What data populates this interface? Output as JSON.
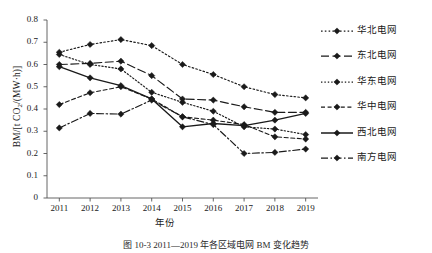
{
  "chart_data": {
    "type": "line",
    "title": "",
    "xlabel": "年份",
    "ylabel": "BM/[t CO2/(MW·h)]",
    "x": [
      2011,
      2012,
      2013,
      2014,
      2015,
      2016,
      2017,
      2018,
      2019
    ],
    "xlim": [
      2010.6,
      2019.4
    ],
    "ylim": [
      0,
      0.8
    ],
    "yticks": [
      "0",
      "0.1",
      "0.2",
      "0.3",
      "0.4",
      "0.5",
      "0.6",
      "0.7",
      "0.8"
    ],
    "ytick_values": [
      0,
      0.1,
      0.2,
      0.3,
      0.4,
      0.5,
      0.6,
      0.7,
      0.8
    ],
    "xticks": [
      "2011",
      "2012",
      "2013",
      "2014",
      "2015",
      "2016",
      "2017",
      "2018",
      "2019"
    ],
    "grid": false,
    "legend_position": "right",
    "series": [
      {
        "name": "华北电网",
        "style": "dotted",
        "dash": "1.6,2.2",
        "color": "#1a1a1a",
        "values": [
          0.655,
          0.69,
          0.712,
          0.685,
          0.6,
          0.555,
          0.5,
          0.465,
          0.45
        ]
      },
      {
        "name": "东北电网",
        "style": "long-dash",
        "dash": "8,3.5",
        "color": "#1a1a1a",
        "values": [
          0.6,
          0.605,
          0.615,
          0.55,
          0.445,
          0.44,
          0.41,
          0.385,
          0.385
        ]
      },
      {
        "name": "华东电网",
        "style": "fine-dot",
        "dash": "1.4,2.0",
        "color": "#1a1a1a",
        "values": [
          0.645,
          0.6,
          0.58,
          0.475,
          0.43,
          0.39,
          0.32,
          0.31,
          0.285
        ]
      },
      {
        "name": "华中电网",
        "style": "short-dash",
        "dash": "4,2.6",
        "color": "#1a1a1a",
        "values": [
          0.42,
          0.473,
          0.5,
          0.445,
          0.365,
          0.35,
          0.33,
          0.275,
          0.265
        ]
      },
      {
        "name": "西北电网",
        "style": "solid",
        "dash": "",
        "color": "#1a1a1a",
        "values": [
          0.59,
          0.54,
          0.505,
          0.445,
          0.32,
          0.335,
          0.325,
          0.35,
          0.38
        ]
      },
      {
        "name": "南方电网",
        "style": "dash-dot",
        "dash": "7,2.5,1.5,2.5",
        "color": "#1a1a1a",
        "values": [
          0.315,
          0.38,
          0.377,
          0.44,
          0.365,
          0.33,
          0.2,
          0.205,
          0.22
        ]
      }
    ]
  },
  "caption": "图 10-3  2011—2019 年各区域电网 BM 变化趋势",
  "axis": {
    "y_title_main": "BM/[t CO",
    "y_title_sub": "2",
    "y_title_rest": "/(MW·h)]"
  }
}
